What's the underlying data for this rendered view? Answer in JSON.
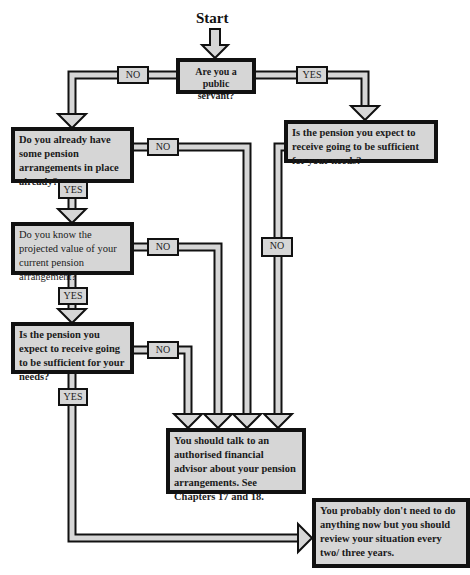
{
  "diagram": {
    "start_label": "Start",
    "nodes": {
      "q_public_servant": "Are you a public servant?",
      "q_existing_arrangements": "Do you already have some pension arrangements in place already?",
      "q_sufficient_public": "Is the pension you expect to receive going to be sufficient for your needs?",
      "q_projected_value": "Do you know the projected value of your current pension arrangement?",
      "q_sufficient": "Is the pension you expect to receive going to be sufficient for your needs?",
      "r_talk_advisor": "You should talk to an authorised financial advisor about your pension arrangements. See Chapters 17 and 18.",
      "r_no_action": "You probably don't need to do anything now but you should review your situation every two/ three years."
    },
    "edge_labels": {
      "public_no": "NO",
      "public_yes": "YES",
      "existing_no": "NO",
      "existing_yes": "YES",
      "sufficient_public_no": "NO",
      "projected_no": "NO",
      "projected_yes": "YES",
      "sufficient_no": "NO",
      "sufficient_yes": "YES"
    },
    "colors": {
      "box_fill": "#d6d6d6",
      "border": "#111111",
      "background": "#ffffff"
    }
  }
}
